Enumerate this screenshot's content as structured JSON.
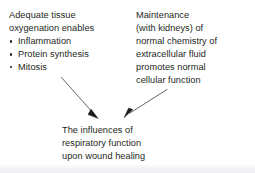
{
  "figure": {
    "type": "concept-diagram",
    "caption_blocks": {
      "oxygenation": {
        "heading_lines": [
          "Adequate tissue",
          "oxygenation enables"
        ],
        "bullets": [
          "Inflammation",
          "Protein synthesis",
          "Mitosis"
        ]
      },
      "maintenance": {
        "lines": [
          "Maintenance",
          "(with kidneys) of",
          "normal chemistry of",
          "extracellular fluid",
          "promotes normal",
          "cellular function"
        ]
      },
      "outcome": {
        "lines": [
          "The influences of",
          "respiratory function",
          "upon wound healing"
        ]
      }
    },
    "arrows": [
      {
        "name": "arrow-oxygenation-to-outcome",
        "from_label": "Adequate tissue oxygenation enables",
        "to_label": "The influences of respiratory function upon wound healing",
        "direction": "down-right"
      },
      {
        "name": "arrow-maintenance-to-outcome",
        "from_label": "Maintenance (with kidneys) of normal chemistry of extracellular fluid promotes normal cellular function",
        "to_label": "The influences of respiratory function upon wound healing",
        "direction": "down-left"
      }
    ],
    "colors": {
      "background": "#ffffff",
      "text": "#231f20",
      "arrow": "#4a4a4f",
      "bottom_band": "#eeeef1"
    }
  }
}
